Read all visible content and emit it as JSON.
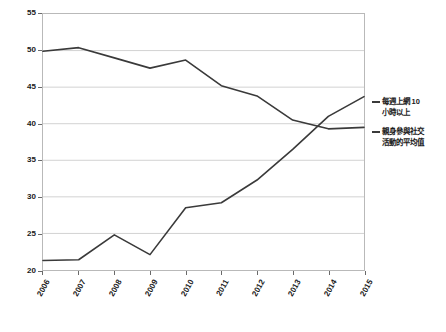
{
  "chart_data": {
    "type": "line",
    "title": "",
    "subtitle": "",
    "xlabel": "",
    "ylabel": "",
    "categories": [
      "2006",
      "2007",
      "2008",
      "2009",
      "2010",
      "2011",
      "2012",
      "2013",
      "2014",
      "2015"
    ],
    "ylim": [
      20,
      55
    ],
    "y_ticks": [
      20,
      25,
      30,
      35,
      40,
      45,
      50,
      55
    ],
    "grid": true,
    "legend_position": "right",
    "series": [
      {
        "name": "每週上網 10 小時以上",
        "color": "#3a3a3a",
        "values": [
          21.3,
          21.4,
          24.8,
          22.1,
          28.5,
          29.2,
          32.3,
          36.5,
          41.0,
          43.7
        ]
      },
      {
        "name": "親身參與社交活動的平均值",
        "color": "#3a3a3a",
        "values": [
          49.9,
          50.4,
          49.0,
          47.6,
          48.7,
          45.2,
          43.8,
          40.5,
          39.3,
          39.5
        ]
      }
    ]
  },
  "legend": {
    "items": [
      {
        "label_line1": "每週上網 10",
        "label_line2": "小時以上"
      },
      {
        "label_line1": "親身參與社交",
        "label_line2": "活動的平均值"
      }
    ]
  }
}
